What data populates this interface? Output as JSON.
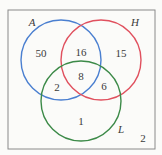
{
  "venn": {
    "universe_box": {
      "x": 8,
      "y": 10,
      "width": 147,
      "height": 139,
      "color": "#8a8a8a"
    },
    "sets": [
      {
        "label": "A",
        "color": "#4a7fd0",
        "cx": 61,
        "cy": 60,
        "r": 40,
        "label_x": 32,
        "label_y": 26
      },
      {
        "label": "H",
        "color": "#e0505e",
        "cx": 101,
        "cy": 60,
        "r": 40,
        "label_x": 135,
        "label_y": 26
      },
      {
        "label": "L",
        "color": "#3c8a48",
        "cx": 81,
        "cy": 101,
        "r": 40,
        "label_x": 121,
        "label_y": 133
      }
    ],
    "regions": [
      {
        "name": "A-only",
        "value": "50",
        "x": 41,
        "y": 57
      },
      {
        "name": "A-and-H-only",
        "value": "16",
        "x": 81,
        "y": 56
      },
      {
        "name": "H-only",
        "value": "15",
        "x": 121,
        "y": 57
      },
      {
        "name": "A-H-L",
        "value": "8",
        "x": 81,
        "y": 80
      },
      {
        "name": "A-and-L-only",
        "value": "2",
        "x": 57,
        "y": 91
      },
      {
        "name": "H-and-L-only",
        "value": "6",
        "x": 104,
        "y": 90
      },
      {
        "name": "L-only",
        "value": "1",
        "x": 81,
        "y": 125
      },
      {
        "name": "outside-all",
        "value": "2",
        "x": 143,
        "y": 142
      }
    ]
  }
}
